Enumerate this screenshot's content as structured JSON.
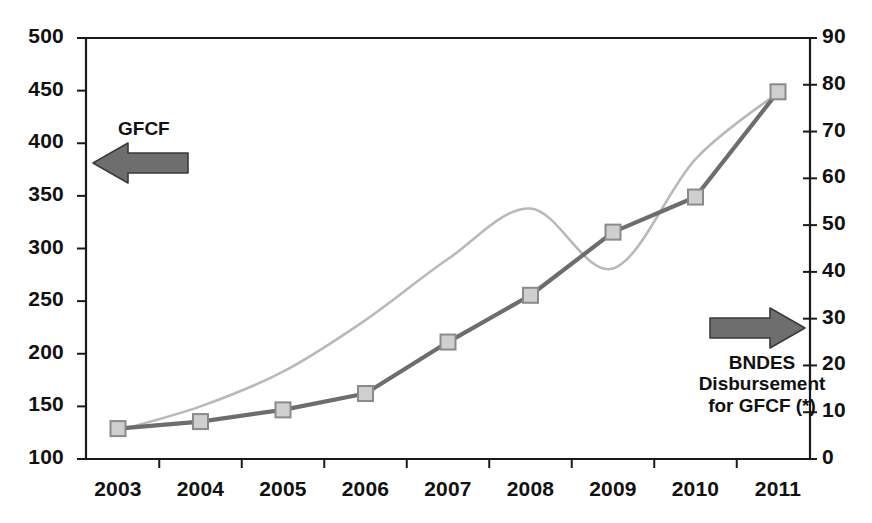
{
  "chart_data": {
    "type": "line",
    "title": "",
    "subtitle": "",
    "xlabel": "",
    "ylabel": "",
    "grid": false,
    "legend_position": "inline-annotations",
    "categories": [
      "2003",
      "2004",
      "2005",
      "2006",
      "2007",
      "2008",
      "2009",
      "2010",
      "2011"
    ],
    "axes": {
      "left": {
        "name": "GFCF",
        "min": 100,
        "max": 500,
        "step": 50,
        "ticks": [
          "500",
          "450",
          "400",
          "350",
          "300",
          "250",
          "200",
          "150",
          "100"
        ]
      },
      "right": {
        "name": "BNDES Disbursement for GFCF (*)",
        "min": 0,
        "max": 90,
        "step": 10,
        "ticks": [
          "90",
          "80",
          "70",
          "60",
          "50",
          "40",
          "30",
          "20",
          "10",
          "0"
        ]
      }
    },
    "series": [
      {
        "name": "GFCF",
        "axis": "left",
        "color": "#b9b9b9",
        "style": "smooth-line",
        "markers": false,
        "values": [
          127,
          150,
          183,
          232,
          290,
          338,
          281,
          385,
          448
        ]
      },
      {
        "name": "BNDES Disbursement for GFCF (*)",
        "axis": "right",
        "color": "#6d6d6d",
        "marker_fill": "#cfcfcf",
        "marker_stroke": "#8a8a8a",
        "style": "line-with-square-markers",
        "markers": true,
        "values": [
          6.5,
          8.0,
          10.5,
          14.0,
          25.0,
          35.0,
          48.5,
          56.0,
          78.5
        ]
      }
    ],
    "annotations": [
      {
        "id": "gfcf",
        "text": "GFCF",
        "arrow": "left-arrow",
        "arrow_color": "#6e6e6e",
        "points_to": "left-axis"
      },
      {
        "id": "bndes",
        "lines": [
          "BNDES",
          "Disbursement",
          "for GFCF (*)"
        ],
        "arrow": "right-arrow",
        "arrow_color": "#6e6e6e",
        "points_to": "right-axis"
      }
    ]
  },
  "colors": {
    "axis": "#1a1a1a",
    "background": "#ffffff",
    "gfcf_line": "#b9b9b9",
    "bndes_line": "#6d6d6d",
    "marker_fill": "#cfcfcf",
    "arrow": "#6e6e6e"
  },
  "annotations": {
    "gfcf_label": "GFCF",
    "bndes_line1": "BNDES",
    "bndes_line2": "Disbursement",
    "bndes_line3": "for GFCF (*)"
  }
}
